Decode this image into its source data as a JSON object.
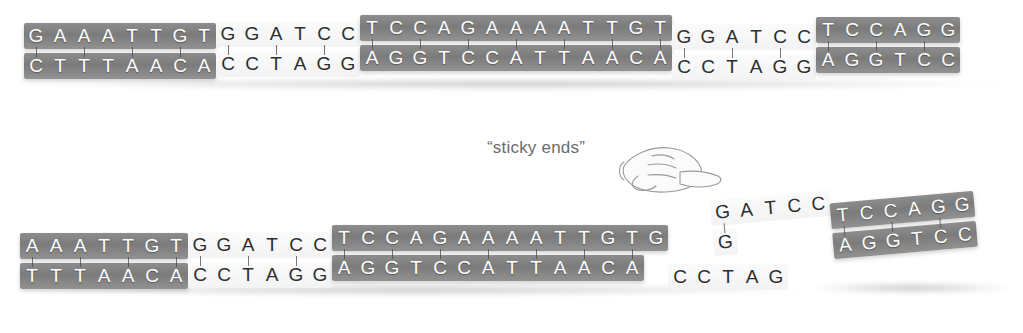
{
  "figure": {
    "label_sticky_ends": "“sticky ends”",
    "colors": {
      "shaded_band": "#7f7f7f",
      "open_band": "#f7f7f7",
      "shaded_letter": "#fdfdfd",
      "open_letter": "#2e2e2e",
      "label_text": "#6b6b6b",
      "background": "#ffffff"
    }
  },
  "panels": {
    "uncut": {
      "name": "intact-dna-duplex",
      "segments": [
        {
          "id": "u1",
          "style": "shaded",
          "top": "GAAATTGT",
          "bottom": "CTTTAACA"
        },
        {
          "id": "u2",
          "style": "open",
          "top": "GGATCC",
          "bottom": "CCTAGG"
        },
        {
          "id": "u3",
          "style": "shaded",
          "top": "TCCAGAAAATTGT",
          "bottom": "AGGTCCATTAACA"
        },
        {
          "id": "u4",
          "style": "open",
          "top": "GGATCC",
          "bottom": "CCTAGG"
        },
        {
          "id": "u5",
          "style": "shaded",
          "top": "TCCAGG",
          "bottom": "AGGTCC"
        }
      ],
      "top_strand_sequence": "GAAATTGTGGATCCTCCAGAAAATTGTGGATCCTCCAGG",
      "bottom_strand_sequence": "CTTTAACACCTAGGAGGTCCATTAACACCTAGGAGGTCC"
    },
    "cut": {
      "name": "cut-dna-duplex-with-sticky-ends",
      "left_fragment": {
        "name": "left-fragment",
        "segments": [
          {
            "id": "c1",
            "style": "shaded",
            "top": "AAATTGT",
            "bottom": "TTTAACA"
          },
          {
            "id": "c2",
            "style": "open",
            "top": "GGATCC",
            "bottom": "CCTAGG"
          },
          {
            "id": "c3",
            "style": "shaded",
            "top": "TCCAGAAAATTGTG",
            "bottom": "AGGTCCATTAACA"
          },
          {
            "id": "c4",
            "style": "open",
            "top": "",
            "bottom": "CCTAG"
          }
        ],
        "top_strand_sequence": "AAATTGTGGATCCTCCAGAAAATTGTG",
        "bottom_strand_sequence": "TTTAACACCTAGGAGGTCCATTAACACCTAG",
        "overhang": "CTAG",
        "overhang_strand": "bottom"
      },
      "right_fragment": {
        "name": "right-fragment",
        "segments": [
          {
            "id": "r1",
            "style": "open",
            "top": "GATCC",
            "bottom": "G"
          },
          {
            "id": "r2",
            "style": "shaded",
            "top": "TCCAGG",
            "bottom": "AGGTCC"
          }
        ],
        "top_strand_sequence": "GATCCTCCAGG",
        "bottom_strand_sequence": "GAGGTCC",
        "overhang": "GATC",
        "overhang_strand": "top"
      }
    }
  },
  "annotations": {
    "hand_pointer": "pointing-hand-icon"
  }
}
